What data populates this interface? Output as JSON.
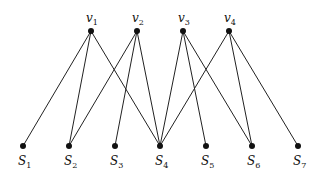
{
  "diagram": {
    "type": "bipartite-graph",
    "top_nodes": [
      {
        "id": "v1",
        "label": "v",
        "sub": "1",
        "x": 91,
        "y": 31
      },
      {
        "id": "v2",
        "label": "v",
        "sub": "2",
        "x": 137,
        "y": 31
      },
      {
        "id": "v3",
        "label": "v",
        "sub": "3",
        "x": 183,
        "y": 31
      },
      {
        "id": "v4",
        "label": "v",
        "sub": "4",
        "x": 229,
        "y": 31
      }
    ],
    "bottom_nodes": [
      {
        "id": "S1",
        "label": "S",
        "sub": "1",
        "x": 23,
        "y": 146
      },
      {
        "id": "S2",
        "label": "S",
        "sub": "2",
        "x": 69,
        "y": 146
      },
      {
        "id": "S3",
        "label": "S",
        "sub": "3",
        "x": 115,
        "y": 146
      },
      {
        "id": "S4",
        "label": "S",
        "sub": "4",
        "x": 160,
        "y": 146
      },
      {
        "id": "S5",
        "label": "S",
        "sub": "5",
        "x": 206,
        "y": 146
      },
      {
        "id": "S6",
        "label": "S",
        "sub": "6",
        "x": 252,
        "y": 146
      },
      {
        "id": "S7",
        "label": "S",
        "sub": "7",
        "x": 298,
        "y": 146
      }
    ],
    "edges": [
      [
        "v1",
        "S1"
      ],
      [
        "v1",
        "S2"
      ],
      [
        "v1",
        "S4"
      ],
      [
        "v2",
        "S2"
      ],
      [
        "v2",
        "S3"
      ],
      [
        "v2",
        "S4"
      ],
      [
        "v3",
        "S4"
      ],
      [
        "v3",
        "S5"
      ],
      [
        "v3",
        "S6"
      ],
      [
        "v4",
        "S4"
      ],
      [
        "v4",
        "S6"
      ],
      [
        "v4",
        "S7"
      ]
    ],
    "colors": {
      "edge": "#222222",
      "node": "#111111",
      "background": "#ffffff"
    }
  }
}
